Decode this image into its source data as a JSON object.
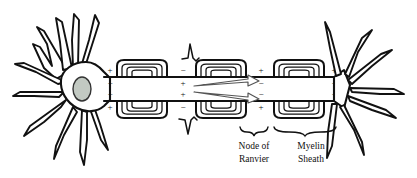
{
  "diagram": {
    "background_color": "#ffffff",
    "ink_color": "#111111",
    "nucleus_color": "#c2c9c2",
    "arrow_outline_color": "#555555",
    "width": 417,
    "height": 178
  },
  "labels": [
    {
      "id": "node-of-ranvier",
      "line1": "Node of",
      "line2": "Ranvier",
      "x": 254,
      "y": 146
    },
    {
      "id": "myelin-sheath",
      "line1": "Myelin",
      "line2": "Sheath",
      "x": 311,
      "y": 146
    }
  ],
  "braces": [
    {
      "id": "node-brace",
      "x_start": 240,
      "x_end": 268,
      "y": 130,
      "depth": 5
    },
    {
      "id": "myelin-brace",
      "x_start": 272,
      "x_end": 338,
      "y": 130,
      "depth": 5
    }
  ],
  "soma": {
    "name": "cell-body",
    "center_x": 82,
    "center_y": 89,
    "nucleus": {
      "cx": 82,
      "cy": 89,
      "rx": 9,
      "ry": 12,
      "fill": "#c2c9c2"
    }
  },
  "dendrites": {
    "count": 9,
    "side": "left"
  },
  "terminals": {
    "count": 7,
    "side": "right"
  },
  "axon": {
    "top_y": 77,
    "bottom_y": 101,
    "x_start": 96,
    "x_end": 340
  },
  "myelin_segments": [
    {
      "index": 0,
      "x": 117,
      "width": 50,
      "rings": 3
    },
    {
      "index": 1,
      "x": 196,
      "width": 50,
      "rings": 3
    },
    {
      "index": 2,
      "x": 274,
      "width": 50,
      "rings": 3
    }
  ],
  "nodes_of_ranvier": [
    {
      "index": 0,
      "x": 108
    },
    {
      "index": 1,
      "x": 180
    },
    {
      "index": 2,
      "x": 259
    },
    {
      "index": 3,
      "x": 335
    }
  ],
  "charges": {
    "description": "Membrane polarity markers: plus outside and minus inside at resting nodes; reversed at the depolarized node.",
    "top_outside": [
      "+",
      "−",
      "+",
      "+"
    ],
    "top_inside": [
      "−",
      "+",
      "−",
      "−"
    ],
    "bottom_inside": [
      "−",
      "+",
      "−",
      "−"
    ],
    "bottom_outside": [
      "+",
      "−",
      "+",
      "+"
    ],
    "plus": "+",
    "minus": "−"
  },
  "spikes": [
    {
      "id": "action-potential-spike-top",
      "x": 192,
      "y": 58,
      "direction": "up"
    },
    {
      "id": "action-potential-spike-bottom",
      "x": 189,
      "y": 120,
      "direction": "down"
    }
  ],
  "current_arrows": [
    {
      "id": "ion-current-arrow-upper",
      "from_x": 196,
      "from_y": 84,
      "to_x": 262,
      "to_y": 80
    },
    {
      "id": "ion-current-arrow-lower",
      "from_x": 196,
      "from_y": 94,
      "to_x": 262,
      "to_y": 97
    }
  ]
}
